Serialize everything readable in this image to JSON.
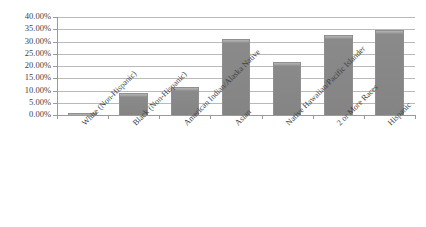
{
  "chart_data": {
    "type": "bar",
    "title": "",
    "subtitle": "",
    "xlabel": "",
    "ylabel": "",
    "categories": [
      "White (Non-Hispanic)",
      "Black (Non-Hispanic)",
      "American Indian/Alaska Native",
      "Asian",
      "Native Hawaiian/Pacific Islander",
      "2 or More Races",
      "Hispanic"
    ],
    "values": [
      1.0,
      9.0,
      11.5,
      31.0,
      21.5,
      32.5,
      34.5
    ],
    "value_labels": [
      "1.00%",
      "9.00%",
      "11.50%",
      "31.00%",
      "21.50%",
      "32.50%",
      "34.50%"
    ],
    "ylim": [
      0,
      40
    ],
    "ytick_step": 5,
    "ytick_labels": [
      "40.00%",
      "35.00%",
      "30.00%",
      "25.00%",
      "20.00%",
      "15.00%",
      "10.00%",
      "5.00%",
      "0.00%"
    ],
    "ytick_values": [
      40,
      35,
      30,
      25,
      20,
      15,
      10,
      5,
      0
    ],
    "grid": true,
    "grid_axis": "y",
    "legend": false,
    "legend_position": "none",
    "series": [
      {
        "name": "",
        "values": [
          1.0,
          9.0,
          11.5,
          31.0,
          21.5,
          32.5,
          34.5
        ]
      }
    ],
    "colors": {
      "bar_fill": "#848484",
      "bar_top_highlight": "#b4b4b4",
      "bar_border": "#8f8f8f",
      "gridline": "#b9b9b9",
      "axis": "#9a9a9a",
      "text": "#3f3f3f",
      "background": "#ffffff"
    }
  }
}
